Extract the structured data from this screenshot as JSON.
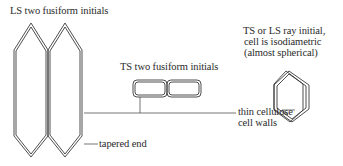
{
  "labels": {
    "ls_fusiform": "LS two fusiform initials",
    "ts_fusiform": "TS two fusiform initials",
    "ray_line1": "TS or LS ray initial,",
    "ray_line2": "cell is isodiametric",
    "ray_line3": "(almost spherical)",
    "walls_line1": "thin cellulose",
    "walls_line2": "cell walls",
    "tapered_end": "tapered end"
  },
  "colors": {
    "stroke": "#3a3a3a",
    "text": "#2a2a2a",
    "background": "#ffffff"
  }
}
